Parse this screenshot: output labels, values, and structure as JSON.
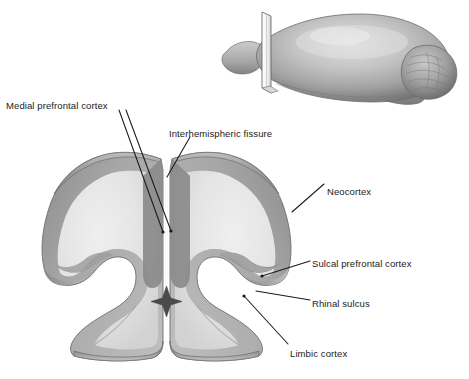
{
  "figure": {
    "type": "anatomical-illustration",
    "background_color": "#ffffff",
    "ink_color": "#1a1a1a"
  },
  "inset": {
    "name": "lateral-brain-view",
    "description": "lateral view of brain with section plane marker",
    "parts": {
      "cerebrum": "cerebrum",
      "section_plane": "section-plane-blade",
      "cerebellum": "cerebellum",
      "brainstem": "brainstem",
      "olfactory_bulb": "olfactory-bulb"
    }
  },
  "section": {
    "name": "coronal-section",
    "parts": {
      "left_hemisphere": "left-hemisphere",
      "right_hemisphere": "right-hemisphere",
      "cortical_ribbon": "cortical-gray-matter-ribbon",
      "white_matter": "white-matter-interior",
      "ventricle": "third-ventricle",
      "cut_edge": "cut-edge-bevel",
      "midline_fissure": "interhemispheric-fissure",
      "rhinal_sulcus_left": "rhinal-sulcus-left",
      "rhinal_sulcus_right": "rhinal-sulcus-right"
    }
  },
  "labels": [
    {
      "id": "medial-prefrontal-cortex",
      "text": "Medial prefrontal cortex",
      "x": 6,
      "y": 100,
      "align": "left"
    },
    {
      "id": "interhemispheric-fissure",
      "text": "Interhemispheric fissure",
      "x": 169,
      "y": 128,
      "align": "left"
    },
    {
      "id": "neocortex",
      "text": "Neocortex",
      "x": 327,
      "y": 186,
      "align": "left"
    },
    {
      "id": "sulcal-prefrontal-cortex",
      "text": "Sulcal prefrontal cortex",
      "x": 312,
      "y": 258,
      "align": "left"
    },
    {
      "id": "rhinal-sulcus",
      "text": "Rhinal sulcus",
      "x": 312,
      "y": 298,
      "align": "left"
    },
    {
      "id": "limbic-cortex",
      "text": "Limbic cortex",
      "x": 290,
      "y": 348,
      "align": "left"
    }
  ],
  "leader_lines": [
    {
      "id": "leader-medial-prefrontal-a",
      "from": [
        119,
        110
      ],
      "to": [
        163,
        232
      ]
    },
    {
      "id": "leader-medial-prefrontal-b",
      "from": [
        124,
        110
      ],
      "to": [
        170,
        230
      ]
    },
    {
      "id": "leader-interhemispheric",
      "from": [
        188,
        136
      ],
      "to": [
        168,
        176
      ]
    },
    {
      "id": "leader-neocortex",
      "from": [
        323,
        184
      ],
      "to": [
        294,
        211
      ]
    },
    {
      "id": "leader-sulcal-prefrontal",
      "from": [
        309,
        260
      ],
      "to": [
        264,
        275
      ]
    },
    {
      "id": "leader-rhinal-sulcus",
      "from": [
        309,
        300
      ],
      "to": [
        258,
        290
      ]
    },
    {
      "id": "leader-limbic-cortex",
      "from": [
        287,
        344
      ],
      "to": [
        245,
        296
      ]
    }
  ],
  "palette": {
    "cortex_ribbon_dark": "#9a9a9a",
    "cortex_ribbon_mid": "#b2b2b2",
    "white_matter_light": "#e6e6e6",
    "white_matter_mid": "#d8d8d8",
    "cut_edge": "#8e8e8e",
    "outline": "#6f6f6f",
    "inset_brain_light": "#cfcfcf",
    "inset_brain_dark": "#7d7d7d",
    "background": "#ffffff"
  }
}
